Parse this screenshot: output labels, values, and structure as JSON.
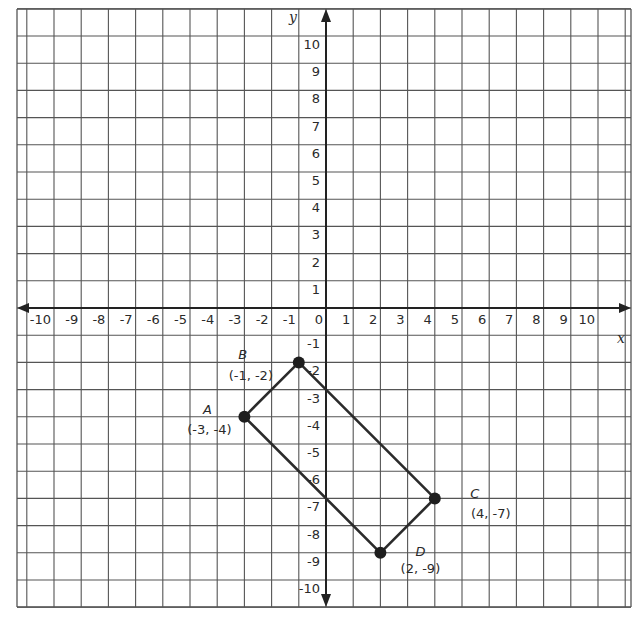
{
  "chart_data": {
    "type": "scatter",
    "title": "",
    "xlabel": "x",
    "ylabel": "y",
    "xlim": [
      -10,
      10
    ],
    "ylim": [
      -10,
      10
    ],
    "grid": true,
    "x_ticks": [
      -10,
      -9,
      -8,
      -7,
      -6,
      -5,
      -4,
      -3,
      -2,
      -1,
      0,
      1,
      2,
      3,
      4,
      5,
      6,
      7,
      8,
      9,
      10
    ],
    "y_ticks": [
      -10,
      -9,
      -8,
      -7,
      -6,
      -5,
      -4,
      -3,
      -2,
      -1,
      1,
      2,
      3,
      4,
      5,
      6,
      7,
      8,
      9,
      10
    ],
    "points": [
      {
        "name": "A",
        "x": -3,
        "y": -4,
        "label": "(-3, -4)"
      },
      {
        "name": "B",
        "x": -1,
        "y": -2,
        "label": "(-1, -2)"
      },
      {
        "name": "C",
        "x": 4,
        "y": -7,
        "label": "(4, -7)"
      },
      {
        "name": "D",
        "x": 2,
        "y": -9,
        "label": "(2, -9)"
      }
    ],
    "polygon": [
      "A",
      "B",
      "C",
      "D"
    ],
    "colors": {
      "grid": "#555555",
      "axis": "#222222",
      "shape": "#2b2b2b",
      "point": "#1e1e1e"
    }
  }
}
